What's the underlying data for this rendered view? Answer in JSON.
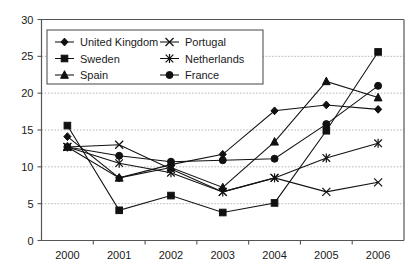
{
  "chart_data": {
    "type": "line",
    "title": "",
    "subtitle": "",
    "xlabel": "",
    "ylabel": "",
    "categories": [
      "2000",
      "2001",
      "2002",
      "2003",
      "2004",
      "2005",
      "2006"
    ],
    "ylim": [
      0,
      30
    ],
    "yticks": [
      0,
      5,
      10,
      15,
      20,
      25,
      30
    ],
    "grid": true,
    "legend_position": "top-left-inside",
    "series": [
      {
        "name": "United Kingdom",
        "marker": "diamond",
        "values": [
          14.1,
          8.5,
          10.3,
          11.7,
          17.6,
          18.4,
          17.8
        ]
      },
      {
        "name": "Sweden",
        "marker": "square",
        "values": [
          15.6,
          4.1,
          6.1,
          3.8,
          5.1,
          14.9,
          25.6
        ]
      },
      {
        "name": "Spain",
        "marker": "triangle",
        "values": [
          12.7,
          8.5,
          9.9,
          7.2,
          13.4,
          21.6,
          19.4
        ]
      },
      {
        "name": "Portugal",
        "marker": "cross-x",
        "values": [
          12.7,
          13.0,
          9.7,
          6.6,
          8.5,
          6.6,
          7.9
        ]
      },
      {
        "name": "Netherlands",
        "marker": "asterisk",
        "values": [
          12.7,
          10.5,
          9.2,
          6.6,
          8.5,
          11.2,
          13.2
        ]
      },
      {
        "name": "France",
        "marker": "circle",
        "values": [
          12.7,
          11.5,
          10.7,
          10.9,
          11.1,
          15.8,
          21.0
        ]
      }
    ]
  },
  "colors": {
    "line": "#111111",
    "axis": "#555555",
    "grid": "#b9b9b9",
    "text": "#1a1a1a",
    "background": "#ffffff"
  }
}
